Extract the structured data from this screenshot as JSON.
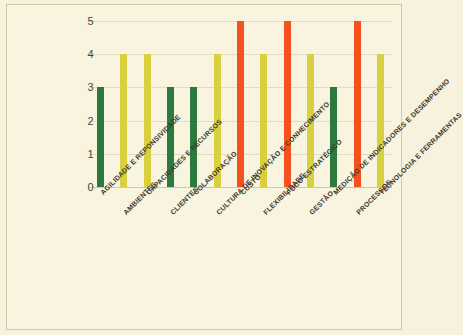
{
  "chart_data": {
    "type": "bar",
    "title": "",
    "xlabel": "",
    "ylabel": "",
    "ylim": [
      0,
      5
    ],
    "yticks": [
      "0",
      "1",
      "2",
      "3",
      "4",
      "5"
    ],
    "grid": true,
    "legend": "none",
    "categories": [
      "AGILIDADE E REPONSIVIDADE",
      "AMBIENTES",
      "CAPACIDADES E RECURSOS",
      "CLIENTES",
      "COLABORAÇÃO",
      "CULTURA DE INOVAÇÃO E CONHECIMENTO",
      "CUSTO",
      "FLEXIBILIDADE",
      "FOCO ESTRATÉGICO",
      "GESTÃO",
      "MEDIÇÃO DE INDICADORES E DESEMPENHO",
      "PROCESSOS",
      "TECNOLOGIA E FERRAMENTAS"
    ],
    "values": [
      3,
      4,
      4,
      3,
      3,
      4,
      5,
      4,
      5,
      4,
      3,
      5,
      4
    ],
    "bar_colors": [
      "#2c7a3d",
      "#d9d040",
      "#d9d040",
      "#2c7a3d",
      "#2c7a3d",
      "#d9d040",
      "#f4511e",
      "#d9d040",
      "#f4511e",
      "#d9d040",
      "#2c7a3d",
      "#f4511e",
      "#d9d040"
    ],
    "label_rows": [
      0,
      1,
      0,
      1,
      0,
      1,
      0,
      1,
      0,
      1,
      0,
      1,
      0
    ]
  },
  "palette": {
    "background": "#f6f2dd",
    "panel": "#f8f4e0",
    "border": "#cfc8a8",
    "grid": "#e0dcc0",
    "green": "#2c7a3d",
    "yellow": "#d9d040",
    "red": "#f4511e",
    "text": "#3d3a2e"
  }
}
